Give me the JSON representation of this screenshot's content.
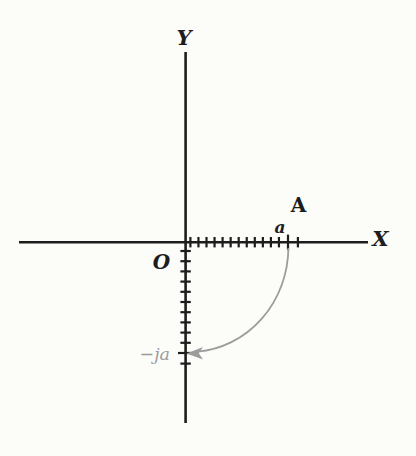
{
  "figure": {
    "axis_labels": {
      "vertical": "Y",
      "horizontal": "X"
    },
    "origin_label": "O",
    "point_label": "A",
    "point_coordinate_label": "a",
    "rotated_point_label": "−ja",
    "colors": {
      "ink": "#1d1d1d",
      "accent_gray": "#9c9c9c",
      "background": "#fcfcf9"
    },
    "geometry": {
      "x_axis": {
        "y": 242.2,
        "x1": 19,
        "x2": 368
      },
      "y_axis": {
        "x": 185.6,
        "y1": 52,
        "y2": 423
      },
      "x_ticks": {
        "start": 190.4,
        "spacing": 8.05,
        "count": 12,
        "major": 288,
        "extra": 297.9,
        "small_half": 5.2,
        "major_half": 7.6
      },
      "y_ticks": {
        "start": 251,
        "spacing": 10.2,
        "count": 10,
        "major": 353,
        "extra": 363.6,
        "small_half": 5.2,
        "major_half": 7.6
      }
    }
  }
}
